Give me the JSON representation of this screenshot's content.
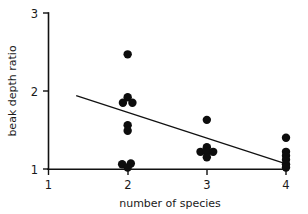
{
  "chart_data": {
    "type": "scatter",
    "title": "",
    "xlabel": "number of species",
    "ylabel": "beak depth ratio",
    "xlim": [
      1,
      4
    ],
    "ylim": [
      1,
      3
    ],
    "xticks": [
      1,
      2,
      3,
      4
    ],
    "xtick_labels": [
      "1",
      "2",
      "3",
      "4"
    ],
    "yticks": [
      1,
      2,
      3
    ],
    "ytick_labels": [
      "1",
      "2",
      "3"
    ],
    "grid": false,
    "legend": false,
    "series": [
      {
        "name": "observations",
        "marker": "filled-circle",
        "color": "#0d0d0d",
        "points": [
          {
            "x": 2.0,
            "y": 2.47
          },
          {
            "x": 2.0,
            "y": 1.92
          },
          {
            "x": 1.94,
            "y": 1.85
          },
          {
            "x": 2.06,
            "y": 1.85
          },
          {
            "x": 2.0,
            "y": 1.56
          },
          {
            "x": 2.0,
            "y": 1.49
          },
          {
            "x": 1.93,
            "y": 1.06
          },
          {
            "x": 2.04,
            "y": 1.07
          },
          {
            "x": 2.0,
            "y": 1.02
          },
          {
            "x": 3.0,
            "y": 1.63
          },
          {
            "x": 3.0,
            "y": 1.28
          },
          {
            "x": 2.92,
            "y": 1.22
          },
          {
            "x": 3.0,
            "y": 1.22
          },
          {
            "x": 3.08,
            "y": 1.22
          },
          {
            "x": 3.0,
            "y": 1.15
          },
          {
            "x": 4.0,
            "y": 1.4
          },
          {
            "x": 4.0,
            "y": 1.22
          },
          {
            "x": 4.0,
            "y": 1.17
          },
          {
            "x": 4.0,
            "y": 1.12
          },
          {
            "x": 4.0,
            "y": 1.06
          },
          {
            "x": 4.0,
            "y": 1.02
          }
        ]
      }
    ],
    "trendline": {
      "name": "regression-line",
      "x_start": 1.35,
      "y_start": 1.94,
      "x_end": 4.05,
      "y_end": 1.05,
      "color": "#111111"
    }
  }
}
